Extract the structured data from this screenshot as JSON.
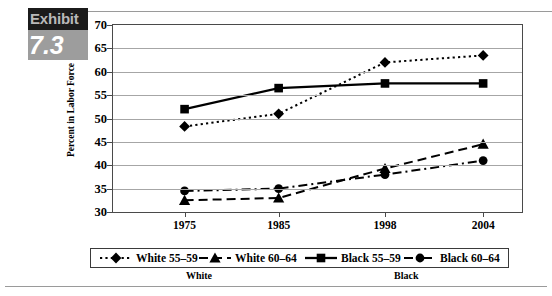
{
  "exhibit": {
    "word": "Exhibit",
    "number": "7.3"
  },
  "chart_data": {
    "type": "line",
    "title": "",
    "xlabel": "",
    "ylabel": "Percent in Labor Force",
    "categories": [
      "1975",
      "1985",
      "1998",
      "2004"
    ],
    "ylim": [
      30,
      70
    ],
    "yticks": [
      30,
      35,
      40,
      45,
      50,
      55,
      60,
      65,
      70
    ],
    "ytick_labels": [
      "30",
      "35",
      "40",
      "45",
      "50",
      "55",
      "60",
      "65",
      "70"
    ],
    "grid": true,
    "legend_position": "bottom",
    "series": [
      {
        "name": "White 55–59",
        "marker": "diamond",
        "line_style": "dotted",
        "color": "#000000",
        "values": [
          48.3,
          51.0,
          62.0,
          63.5
        ]
      },
      {
        "name": "White 60–64",
        "marker": "triangle",
        "line_style": "dashed",
        "color": "#000000",
        "values": [
          32.5,
          33.0,
          39.3,
          44.5
        ]
      },
      {
        "name": "Black 55–59",
        "marker": "square",
        "line_style": "solid",
        "color": "#000000",
        "values": [
          52.0,
          56.5,
          57.5,
          57.5
        ]
      },
      {
        "name": "Black 60–64",
        "marker": "circle",
        "line_style": "dashdot",
        "color": "#000000",
        "values": [
          34.5,
          35.0,
          38.0,
          41.0
        ]
      }
    ],
    "group_labels": [
      {
        "label": "White",
        "center_fraction": 0.26
      },
      {
        "label": "Black",
        "center_fraction": 0.755
      }
    ]
  }
}
